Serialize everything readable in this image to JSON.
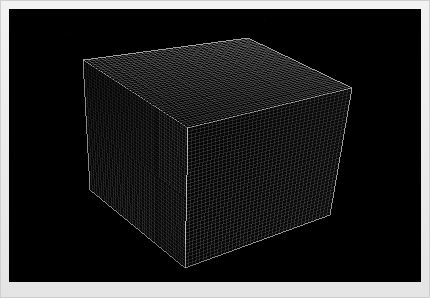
{
  "image": {
    "title": "Wireframe Mesh Cube",
    "width": 430,
    "height": 298,
    "border_color": "#e9e9e9",
    "canvas_color": "#000000"
  },
  "viewport": {
    "x": 9,
    "y": 9,
    "width": 412,
    "height": 273,
    "background": "#000000",
    "label": "3D render viewport"
  },
  "render": {
    "object_name": "cube",
    "shading": "wireframe",
    "projection": "perspective",
    "view": "three-quarter",
    "line_color": "#b9b9b9",
    "background_color": "#000000"
  },
  "chart_data": {
    "type": "scatter",
    "xlabel": "",
    "ylabel": "",
    "subdivisions_u": 40,
    "subdivisions_v": 40,
    "vertices": {
      "top_left": [
        83,
        60
      ],
      "top_back": [
        248,
        38
      ],
      "top_right": [
        352,
        88
      ],
      "top_front": [
        188,
        128
      ],
      "bottom_left": [
        90,
        190
      ],
      "bottom_front": [
        185,
        268
      ],
      "bottom_right": [
        330,
        215
      ]
    },
    "faces": [
      {
        "name": "top-face",
        "corners": [
          "top_left",
          "top_back",
          "top_right",
          "top_front"
        ],
        "brightness": 0.62
      },
      {
        "name": "left-face",
        "corners": [
          "top_left",
          "top_front",
          "bottom_front",
          "bottom_left"
        ],
        "brightness": 0.3
      },
      {
        "name": "right-face",
        "corners": [
          "top_front",
          "top_right",
          "bottom_right",
          "bottom_front"
        ],
        "brightness": 0.46
      }
    ]
  },
  "overlay": {
    "has_labels": false,
    "has_axes": false,
    "has_legend": false
  }
}
